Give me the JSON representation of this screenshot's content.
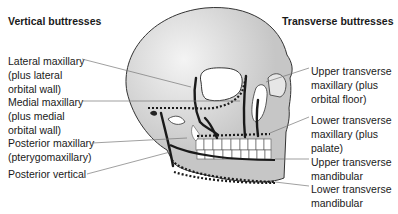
{
  "headings": {
    "left": "Vertical buttresses",
    "right": "Transverse buttresses"
  },
  "left_labels": [
    "Lateral maxillary\n(plus lateral\norbital wall)",
    "Medial maxillary\n(plus medial\norbital wall)",
    "Posterior maxillary\n(pterygomaxillary)",
    "Posterior vertical"
  ],
  "right_labels": [
    "Upper transverse\nmaxillary (plus\norbital floor)",
    "Lower transverse\nmaxillary (plus\npalate)",
    "Upper transverse\nmandibular",
    "Lower transverse\nmandibular"
  ],
  "colors": {
    "skull_fill": "#c8c8c8",
    "skull_highlight": "#f2f2f2",
    "outline": "#333333",
    "buttress": "#1a1a1a",
    "leader": "#777777",
    "teeth": "#ffffff"
  }
}
